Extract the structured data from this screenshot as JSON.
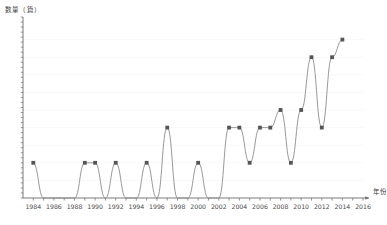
{
  "chart_data": {
    "type": "line",
    "title": "",
    "ylabel": "数量（篇）",
    "xlabel": "年份",
    "grid": "horizontal-faint",
    "legend": "none",
    "xlim": [
      1983,
      2016
    ],
    "ylim": [
      0,
      10
    ],
    "x_tick_labels": [
      "1984",
      "1986",
      "1988",
      "1990",
      "1992",
      "1994",
      "1996",
      "1998",
      "2000",
      "2002",
      "2004",
      "2006",
      "2008",
      "2010",
      "2012",
      "2014",
      "2016"
    ],
    "x_tick_step_minor": 1,
    "y_tick_labels": [],
    "x": [
      1984,
      1985,
      1986,
      1987,
      1988,
      1989,
      1990,
      1991,
      1992,
      1993,
      1994,
      1995,
      1996,
      1997,
      1998,
      1999,
      2000,
      2001,
      2002,
      2003,
      2004,
      2005,
      2006,
      2007,
      2008,
      2009,
      2010,
      2011,
      2012,
      2013,
      2014
    ],
    "values": [
      2,
      0,
      0,
      0,
      0,
      2,
      2,
      0,
      2,
      0,
      0,
      2,
      0,
      4,
      0,
      0,
      2,
      0,
      0,
      4,
      4,
      2,
      4,
      4,
      5,
      2,
      5,
      8,
      4,
      8,
      9
    ],
    "series": [
      {
        "name": "数量",
        "line_color": "#8c8c8c",
        "marker_color": "#555555",
        "marker": "square",
        "values": [
          2,
          0,
          0,
          0,
          0,
          2,
          2,
          0,
          2,
          0,
          0,
          2,
          0,
          4,
          0,
          0,
          2,
          0,
          0,
          4,
          4,
          2,
          4,
          4,
          5,
          2,
          5,
          8,
          4,
          8,
          9
        ]
      }
    ],
    "axis_color": "#6b6b6b",
    "grid_color": "#f2f2f2",
    "background": "#ffffff"
  }
}
